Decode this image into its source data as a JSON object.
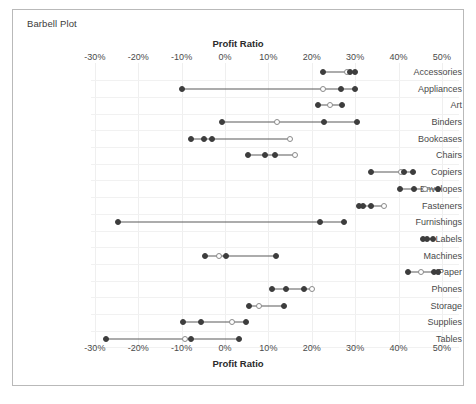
{
  "chart_data": {
    "type": "scatter",
    "title": "Barbell Plot",
    "xlabel": "Profit Ratio",
    "ylabel": "",
    "xlim": [
      -33,
      53
    ],
    "grid": true,
    "legend": "none",
    "xticks": [
      "-30%",
      "-20%",
      "-10%",
      "0%",
      "10%",
      "20%",
      "30%",
      "40%",
      "50%"
    ],
    "xtick_values": [
      -30,
      -20,
      -10,
      0,
      10,
      20,
      30,
      40,
      50
    ],
    "categories": [
      "Accessories",
      "Appliances",
      "Art",
      "Binders",
      "Bookcases",
      "Chairs",
      "Copiers",
      "Envelopes",
      "Fasteners",
      "Furnishings",
      "Labels",
      "Machines",
      "Paper",
      "Phones",
      "Storage",
      "Supplies",
      "Tables"
    ],
    "marker_styles": {
      "filled": "#3d3d3d",
      "hollow": "#ffffff",
      "hollow_border": "#8a8a8a",
      "connector": "#5a5a5a"
    },
    "rows": [
      {
        "category": "Accessories",
        "range": [
          22.5,
          30.0
        ],
        "points": [
          {
            "value": 22.5,
            "style": "filled"
          },
          {
            "value": 28.2,
            "style": "hollow"
          },
          {
            "value": 28.8,
            "style": "filled"
          },
          {
            "value": 30.0,
            "style": "filled"
          }
        ]
      },
      {
        "category": "Appliances",
        "range": [
          -10.0,
          30.0
        ],
        "points": [
          {
            "value": -10.0,
            "style": "filled"
          },
          {
            "value": 22.5,
            "style": "hollow"
          },
          {
            "value": 26.8,
            "style": "filled"
          },
          {
            "value": 30.0,
            "style": "filled"
          }
        ]
      },
      {
        "category": "Art",
        "range": [
          21.5,
          27.0
        ],
        "points": [
          {
            "value": 21.5,
            "style": "filled"
          },
          {
            "value": 24.3,
            "style": "hollow"
          },
          {
            "value": 27.0,
            "style": "filled"
          }
        ]
      },
      {
        "category": "Binders",
        "range": [
          -0.7,
          30.5
        ],
        "points": [
          {
            "value": -0.7,
            "style": "filled"
          },
          {
            "value": 12.0,
            "style": "hollow"
          },
          {
            "value": 22.8,
            "style": "filled"
          },
          {
            "value": 30.5,
            "style": "filled"
          }
        ]
      },
      {
        "category": "Bookcases",
        "range": [
          -7.8,
          15.0
        ],
        "points": [
          {
            "value": -7.8,
            "style": "filled"
          },
          {
            "value": -4.8,
            "style": "filled"
          },
          {
            "value": -3.0,
            "style": "filled"
          },
          {
            "value": 15.0,
            "style": "hollow"
          }
        ]
      },
      {
        "category": "Chairs",
        "range": [
          5.3,
          16.1
        ],
        "points": [
          {
            "value": 5.3,
            "style": "filled"
          },
          {
            "value": 9.2,
            "style": "filled"
          },
          {
            "value": 11.5,
            "style": "filled"
          },
          {
            "value": 16.1,
            "style": "hollow"
          }
        ]
      },
      {
        "category": "Copiers",
        "range": [
          33.6,
          43.3
        ],
        "points": [
          {
            "value": 33.6,
            "style": "filled"
          },
          {
            "value": 40.5,
            "style": "hollow"
          },
          {
            "value": 41.2,
            "style": "filled"
          },
          {
            "value": 43.3,
            "style": "filled"
          }
        ]
      },
      {
        "category": "Envelopes",
        "range": [
          40.3,
          49.0
        ],
        "points": [
          {
            "value": 40.3,
            "style": "filled"
          },
          {
            "value": 43.5,
            "style": "filled"
          },
          {
            "value": 46.2,
            "style": "hollow"
          },
          {
            "value": 49.0,
            "style": "filled"
          }
        ]
      },
      {
        "category": "Fasteners",
        "range": [
          30.8,
          36.6
        ],
        "points": [
          {
            "value": 30.8,
            "style": "filled"
          },
          {
            "value": 31.8,
            "style": "filled"
          },
          {
            "value": 33.6,
            "style": "filled"
          },
          {
            "value": 36.6,
            "style": "hollow"
          }
        ]
      },
      {
        "category": "Furnishings",
        "range": [
          -24.6,
          27.4
        ],
        "points": [
          {
            "value": -24.6,
            "style": "filled"
          },
          {
            "value": 21.9,
            "style": "filled"
          },
          {
            "value": 27.4,
            "style": "filled"
          }
        ]
      },
      {
        "category": "Labels",
        "range": [
          45.6,
          47.9
        ],
        "points": [
          {
            "value": 45.6,
            "style": "filled"
          },
          {
            "value": 46.5,
            "style": "filled"
          },
          {
            "value": 47.9,
            "style": "filled"
          }
        ]
      },
      {
        "category": "Machines",
        "range": [
          -4.6,
          11.7
        ],
        "points": [
          {
            "value": -4.6,
            "style": "filled"
          },
          {
            "value": -1.4,
            "style": "hollow"
          },
          {
            "value": 0.2,
            "style": "filled"
          },
          {
            "value": 11.7,
            "style": "filled"
          }
        ]
      },
      {
        "category": "Paper",
        "range": [
          42.1,
          49.0
        ],
        "points": [
          {
            "value": 42.1,
            "style": "filled"
          },
          {
            "value": 45.3,
            "style": "hollow"
          },
          {
            "value": 48.1,
            "style": "filled"
          },
          {
            "value": 49.0,
            "style": "filled"
          }
        ]
      },
      {
        "category": "Phones",
        "range": [
          10.8,
          20.0
        ],
        "points": [
          {
            "value": 10.8,
            "style": "filled"
          },
          {
            "value": 14.0,
            "style": "filled"
          },
          {
            "value": 18.2,
            "style": "filled"
          },
          {
            "value": 20.0,
            "style": "hollow"
          }
        ]
      },
      {
        "category": "Storage",
        "range": [
          5.5,
          13.6
        ],
        "points": [
          {
            "value": 5.5,
            "style": "filled"
          },
          {
            "value": 7.8,
            "style": "hollow"
          },
          {
            "value": 13.6,
            "style": "filled"
          }
        ]
      },
      {
        "category": "Supplies",
        "range": [
          -9.7,
          4.8
        ],
        "points": [
          {
            "value": -9.7,
            "style": "filled"
          },
          {
            "value": -5.5,
            "style": "filled"
          },
          {
            "value": 1.6,
            "style": "hollow"
          },
          {
            "value": 4.8,
            "style": "filled"
          }
        ]
      },
      {
        "category": "Tables",
        "range": [
          -27.4,
          3.2
        ],
        "points": [
          {
            "value": -27.4,
            "style": "filled"
          },
          {
            "value": -9.2,
            "style": "hollow"
          },
          {
            "value": -7.8,
            "style": "filled"
          },
          {
            "value": 3.2,
            "style": "filled"
          }
        ]
      }
    ]
  }
}
